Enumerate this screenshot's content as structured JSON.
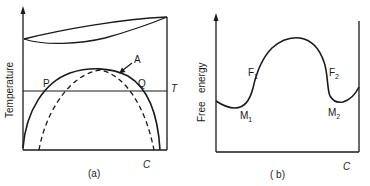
{
  "panel_a": {
    "caption": "(a)",
    "y_axis_label": "Temperature",
    "x_axis_label": "C",
    "temperature_line_label": "T",
    "point_left_label": "P",
    "point_right_label": "Q",
    "arrow_label": "A",
    "curves": [
      "liquidus-solidus lens",
      "solvus (miscibility gap)",
      "spinodal (dashed)"
    ]
  },
  "panel_b": {
    "caption": "( b)",
    "y_axis_label": "Free   energy",
    "x_axis_label": "C",
    "minimum_1": {
      "base": "M",
      "sub": "1"
    },
    "minimum_2": {
      "base": "M",
      "sub": "2"
    },
    "inflection_1": {
      "base": "F",
      "sub": "1"
    },
    "inflection_2": {
      "base": "F",
      "sub": "2"
    }
  },
  "colors": {
    "line": "#1a1a1a",
    "background": "#ffffff"
  }
}
